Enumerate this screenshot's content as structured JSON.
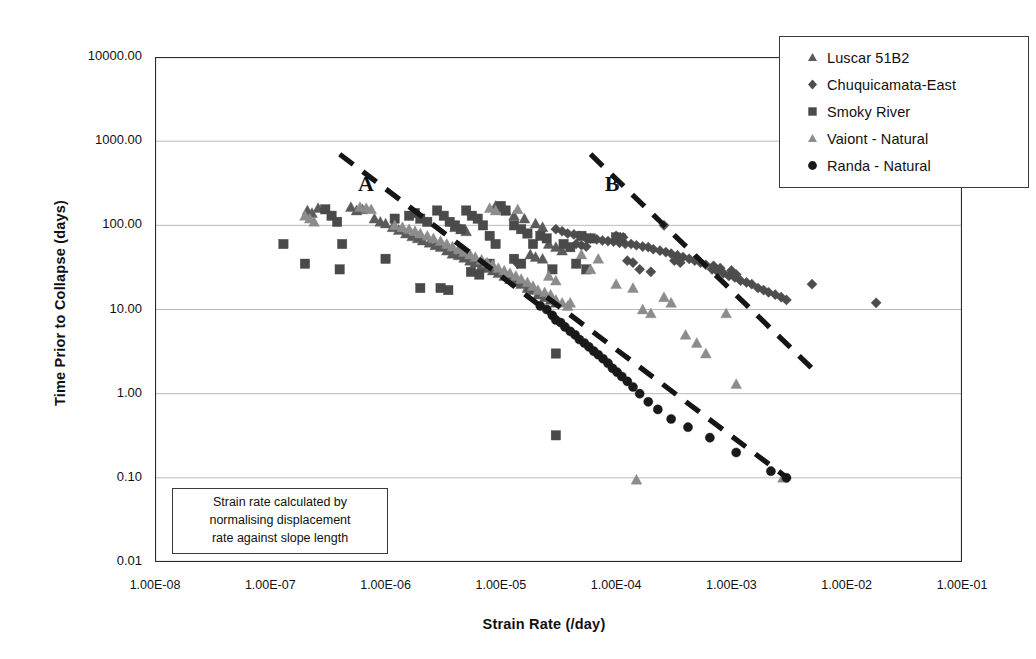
{
  "chart_data": {
    "type": "scatter",
    "title": "",
    "xlabel": "Strain Rate (/day)",
    "ylabel": "Time Prior to Collapse (days)",
    "xscale": "log",
    "yscale": "log",
    "xlim": [
      1e-08,
      0.1
    ],
    "ylim": [
      0.01,
      10000
    ],
    "grid": true,
    "legend_position": "top-right",
    "xticks": [
      "1.00E-08",
      "1.00E-07",
      "1.00E-06",
      "1.00E-05",
      "1.00E-04",
      "1.00E-03",
      "1.00E-02",
      "1.00E-01"
    ],
    "yticks": [
      "0.01",
      "0.10",
      "1.00",
      "10.00",
      "100.00",
      "1000.00",
      "10000.00"
    ],
    "annotations": [
      {
        "label": "A",
        "x": 6.5e-07,
        "y": 300
      },
      {
        "label": "B",
        "x": 9e-05,
        "y": 300
      }
    ],
    "trendlines": [
      {
        "name": "A",
        "style": "dashed",
        "x0": 4e-07,
        "y0": 700,
        "x1": 3e-05,
        "y1": 8.0
      },
      {
        "name": "B",
        "style": "dashed",
        "x0": 6e-05,
        "y0": 700,
        "x1": 0.005,
        "y1": 2.0
      },
      {
        "name": "Randa trend",
        "style": "dashed",
        "x0": 2.5e-05,
        "y0": 14,
        "x1": 0.0032,
        "y1": 0.095
      }
    ],
    "series": [
      {
        "name": "Luscar 51B2",
        "marker": "triangle",
        "color": "#5a5a5a",
        "points": [
          [
            2.1e-07,
            150
          ],
          [
            2.3e-07,
            140
          ],
          [
            2.6e-07,
            160
          ],
          [
            5e-07,
            165
          ],
          [
            5.6e-07,
            150
          ],
          [
            6.3e-07,
            155
          ],
          [
            8e-07,
            120
          ],
          [
            9e-07,
            110
          ],
          [
            1e-06,
            105
          ],
          [
            1.15e-06,
            95
          ],
          [
            1.3e-06,
            88
          ],
          [
            1.5e-06,
            80
          ],
          [
            1.7e-06,
            74
          ],
          [
            1.9e-06,
            70
          ],
          [
            2.1e-06,
            66
          ],
          [
            2.4e-06,
            62
          ],
          [
            2.7e-06,
            58
          ],
          [
            3e-06,
            55
          ],
          [
            3.4e-06,
            50
          ],
          [
            3.8e-06,
            46
          ],
          [
            4.3e-06,
            44
          ],
          [
            4.8e-06,
            41
          ],
          [
            5.4e-06,
            38
          ],
          [
            6e-06,
            36
          ],
          [
            6.8e-06,
            33
          ],
          [
            7.6e-06,
            31
          ],
          [
            8.5e-06,
            29
          ],
          [
            9.5e-06,
            27
          ],
          [
            1.07e-05,
            25
          ],
          [
            1.2e-05,
            23
          ],
          [
            1.35e-05,
            21
          ],
          [
            1.5e-05,
            20
          ],
          [
            1.7e-05,
            18
          ],
          [
            1.9e-05,
            17
          ],
          [
            2.1e-05,
            15
          ],
          [
            2.4e-05,
            14
          ],
          [
            2.7e-05,
            13
          ],
          [
            3e-05,
            12
          ],
          [
            1.1e-05,
            150
          ],
          [
            1.3e-05,
            130
          ],
          [
            1.6e-05,
            120
          ],
          [
            2e-05,
            105
          ],
          [
            2.3e-05,
            95
          ],
          [
            9e-06,
            170
          ],
          [
            1e-05,
            160
          ],
          [
            2.6e-05,
            60
          ],
          [
            3e-05,
            55
          ],
          [
            3.4e-05,
            50
          ],
          [
            1.8e-05,
            45
          ],
          [
            2e-05,
            42
          ],
          [
            2.3e-05,
            40
          ],
          [
            4e-06,
            95
          ],
          [
            4.5e-06,
            90
          ],
          [
            5e-06,
            85
          ]
        ]
      },
      {
        "name": "Chuquicamata-East",
        "marker": "diamond",
        "color": "#4d4d4d",
        "points": [
          [
            3e-05,
            90
          ],
          [
            3.4e-05,
            85
          ],
          [
            3.8e-05,
            80
          ],
          [
            4.3e-05,
            78
          ],
          [
            4.8e-05,
            75
          ],
          [
            5.4e-05,
            72
          ],
          [
            6e-05,
            70
          ],
          [
            6.8e-05,
            68
          ],
          [
            7.6e-05,
            66
          ],
          [
            8.5e-05,
            65
          ],
          [
            9.5e-05,
            64
          ],
          [
            0.000107,
            62
          ],
          [
            0.00012,
            60
          ],
          [
            0.000135,
            60
          ],
          [
            0.00015,
            58
          ],
          [
            0.00017,
            56
          ],
          [
            0.00019,
            55
          ],
          [
            0.00021,
            52
          ],
          [
            0.00024,
            50
          ],
          [
            0.00027,
            48
          ],
          [
            0.0003,
            46
          ],
          [
            0.00034,
            44
          ],
          [
            0.00038,
            42
          ],
          [
            0.00043,
            40
          ],
          [
            0.00048,
            38
          ],
          [
            0.00054,
            36
          ],
          [
            0.0006,
            34
          ],
          [
            0.00068,
            30
          ],
          [
            0.00076,
            28
          ],
          [
            0.00085,
            27
          ],
          [
            0.00095,
            25
          ],
          [
            0.00107,
            24
          ],
          [
            0.0012,
            22
          ],
          [
            0.00135,
            21
          ],
          [
            0.0015,
            20
          ],
          [
            0.0017,
            18
          ],
          [
            0.0019,
            17
          ],
          [
            0.0021,
            16
          ],
          [
            0.0024,
            15
          ],
          [
            0.0027,
            14
          ],
          [
            0.003,
            13
          ],
          [
            0.005,
            20
          ],
          [
            0.018,
            12
          ],
          [
            0.00026,
            100
          ],
          [
            0.00016,
            30
          ],
          [
            0.0002,
            28
          ],
          [
            0.0007,
            33
          ],
          [
            0.0008,
            31
          ],
          [
            0.001,
            29
          ],
          [
            0.0011,
            26
          ],
          [
            1.4e-05,
            35
          ],
          [
            4.5e-05,
            60
          ],
          [
            5e-05,
            58
          ],
          [
            5.5e-05,
            56
          ],
          [
            0.000125,
            38
          ],
          [
            0.00014,
            36
          ],
          [
            0.00032,
            38
          ],
          [
            0.00036,
            36
          ],
          [
            0.0001,
            75
          ],
          [
            0.000115,
            72
          ]
        ]
      },
      {
        "name": "Smoky River",
        "marker": "square",
        "color": "#4a4a4a",
        "points": [
          [
            1.3e-07,
            60
          ],
          [
            2e-07,
            35
          ],
          [
            3e-07,
            155
          ],
          [
            3.4e-07,
            130
          ],
          [
            3.8e-07,
            110
          ],
          [
            4.2e-07,
            60
          ],
          [
            4e-07,
            30
          ],
          [
            1e-06,
            40
          ],
          [
            1.6e-06,
            130
          ],
          [
            1.8e-06,
            140
          ],
          [
            2e-06,
            120
          ],
          [
            2.3e-06,
            110
          ],
          [
            2e-06,
            18
          ],
          [
            2.8e-06,
            150
          ],
          [
            3.2e-06,
            130
          ],
          [
            3.6e-06,
            110
          ],
          [
            4e-06,
            100
          ],
          [
            4.5e-06,
            90
          ],
          [
            5e-06,
            150
          ],
          [
            5.6e-06,
            130
          ],
          [
            6.3e-06,
            120
          ],
          [
            7e-06,
            100
          ],
          [
            8e-06,
            75
          ],
          [
            9e-06,
            60
          ],
          [
            5.5e-06,
            28
          ],
          [
            6.5e-06,
            26
          ],
          [
            8e-06,
            35
          ],
          [
            1e-05,
            170
          ],
          [
            1.1e-05,
            150
          ],
          [
            1.3e-05,
            100
          ],
          [
            1.5e-05,
            90
          ],
          [
            1.7e-05,
            80
          ],
          [
            1.9e-05,
            60
          ],
          [
            1.3e-05,
            40
          ],
          [
            1.5e-05,
            35
          ],
          [
            2.2e-05,
            75
          ],
          [
            2.5e-05,
            70
          ],
          [
            2.8e-05,
            30
          ],
          [
            3e-05,
            3.0
          ],
          [
            3e-05,
            0.32
          ],
          [
            3.5e-05,
            60
          ],
          [
            4e-05,
            55
          ],
          [
            5e-05,
            75
          ],
          [
            6e-05,
            70
          ],
          [
            4.5e-05,
            35
          ],
          [
            5.5e-05,
            30
          ],
          [
            0.0001,
            72
          ],
          [
            0.00011,
            70
          ],
          [
            3e-06,
            18
          ],
          [
            3.5e-06,
            17
          ],
          [
            1.2e-06,
            120
          ]
        ]
      },
      {
        "name": "Vaiont - Natural",
        "marker": "triangle-light",
        "color": "#8c8c8c",
        "points": [
          [
            2e-07,
            130
          ],
          [
            2.2e-07,
            120
          ],
          [
            2.4e-07,
            110
          ],
          [
            6e-07,
            165
          ],
          [
            6.8e-07,
            160
          ],
          [
            7.5e-07,
            155
          ],
          [
            1.2e-06,
            100
          ],
          [
            1.4e-06,
            95
          ],
          [
            1.6e-06,
            90
          ],
          [
            1.8e-06,
            85
          ],
          [
            2e-06,
            80
          ],
          [
            2.3e-06,
            75
          ],
          [
            2.6e-06,
            70
          ],
          [
            3e-06,
            65
          ],
          [
            3.4e-06,
            60
          ],
          [
            3.8e-06,
            56
          ],
          [
            4.3e-06,
            52
          ],
          [
            4.8e-06,
            48
          ],
          [
            5.4e-06,
            45
          ],
          [
            6e-06,
            42
          ],
          [
            6.8e-06,
            39
          ],
          [
            7.6e-06,
            36
          ],
          [
            8.5e-06,
            34
          ],
          [
            9.5e-06,
            31
          ],
          [
            1.07e-05,
            29
          ],
          [
            1.2e-05,
            27
          ],
          [
            1.35e-05,
            25
          ],
          [
            1.5e-05,
            23
          ],
          [
            1.7e-05,
            21
          ],
          [
            1.9e-05,
            19
          ],
          [
            2.1e-05,
            17
          ],
          [
            2.4e-05,
            16
          ],
          [
            2.7e-05,
            15
          ],
          [
            3e-05,
            13
          ],
          [
            3.4e-05,
            12
          ],
          [
            3.8e-05,
            11
          ],
          [
            8e-06,
            160
          ],
          [
            9e-06,
            150
          ],
          [
            1.4e-05,
            155
          ],
          [
            2.6e-05,
            25
          ],
          [
            3e-05,
            22
          ],
          [
            4e-05,
            12
          ],
          [
            6e-05,
            30
          ],
          [
            0.0001,
            20
          ],
          [
            0.00014,
            18
          ],
          [
            0.00017,
            10
          ],
          [
            0.0002,
            9
          ],
          [
            0.00026,
            14
          ],
          [
            0.0003,
            12
          ],
          [
            0.0004,
            5
          ],
          [
            0.0005,
            4
          ],
          [
            0.0006,
            3
          ],
          [
            0.0009,
            9
          ],
          [
            0.0011,
            1.3
          ],
          [
            0.00015,
            0.095
          ],
          [
            0.0028,
            0.1
          ],
          [
            5e-05,
            45
          ],
          [
            7e-05,
            40
          ]
        ]
      },
      {
        "name": "Randa - Natural",
        "marker": "circle",
        "color": "#1a1a1a",
        "points": [
          [
            2.2e-05,
            11
          ],
          [
            2.5e-05,
            10
          ],
          [
            2.8e-05,
            8.5
          ],
          [
            3e-05,
            7.5
          ],
          [
            3.3e-05,
            7.0
          ],
          [
            3.6e-05,
            6.2
          ],
          [
            4e-05,
            5.5
          ],
          [
            4.4e-05,
            5.0
          ],
          [
            4.8e-05,
            4.4
          ],
          [
            5.3e-05,
            4.0
          ],
          [
            5.8e-05,
            3.6
          ],
          [
            6.4e-05,
            3.2
          ],
          [
            7e-05,
            2.9
          ],
          [
            7.7e-05,
            2.6
          ],
          [
            8.5e-05,
            2.3
          ],
          [
            9.3e-05,
            2.0
          ],
          [
            0.000102,
            1.8
          ],
          [
            0.000112,
            1.6
          ],
          [
            0.000125,
            1.4
          ],
          [
            0.00014,
            1.2
          ],
          [
            0.00016,
            1.0
          ],
          [
            0.00019,
            0.8
          ],
          [
            0.00023,
            0.65
          ],
          [
            0.0003,
            0.5
          ],
          [
            0.00042,
            0.4
          ],
          [
            0.00065,
            0.3
          ],
          [
            0.0011,
            0.2
          ],
          [
            0.0022,
            0.12
          ],
          [
            0.003,
            0.1
          ]
        ]
      }
    ]
  },
  "legend": {
    "items": [
      {
        "label": "Luscar 51B2",
        "marker": "triangle",
        "color": "#5a5a5a"
      },
      {
        "label": "Chuquicamata-East",
        "marker": "diamond",
        "color": "#4d4d4d"
      },
      {
        "label": "Smoky River",
        "marker": "square",
        "color": "#4a4a4a"
      },
      {
        "label": "Vaiont - Natural",
        "marker": "triangle-light",
        "color": "#8c8c8c"
      },
      {
        "label": "Randa - Natural",
        "marker": "circle",
        "color": "#1a1a1a"
      }
    ]
  },
  "annotation_box": {
    "line1": "Strain rate calculated by",
    "line2": "normalising displacement",
    "line3": "rate against slope length"
  },
  "colors": {
    "axis": "#2b2b2b",
    "grid": "#9a9a9a",
    "trendline": "#151515",
    "text": "#111111"
  }
}
